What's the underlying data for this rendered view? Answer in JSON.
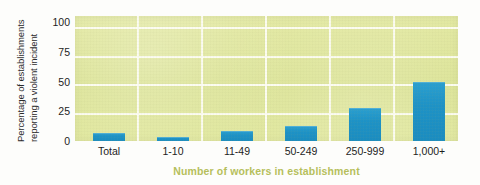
{
  "chart_data": {
    "type": "bar",
    "title": "",
    "subtitle": "",
    "xlabel": "Number of workers in establishment",
    "ylabel": "Percentage of establishments reporting a violent incident",
    "ylabel_lines": [
      "Percentage of establishments",
      "reporting a violent incident"
    ],
    "categories": [
      "Total",
      "1-10",
      "11-49",
      "50-249",
      "250-999",
      "1,000+"
    ],
    "values": [
      7,
      3.5,
      9,
      13,
      29,
      52
    ],
    "yticks": [
      0,
      25,
      50,
      75,
      100
    ],
    "ytick_labels": [
      "0",
      "25",
      "50",
      "75",
      "100"
    ],
    "ylim": [
      0,
      110
    ],
    "grid": "horizontal-and-vertical",
    "legend": "none",
    "series": [
      {
        "name": "Percentage of establishments reporting a violent incident",
        "values": [
          7,
          3.5,
          9,
          13,
          29,
          52
        ]
      }
    ],
    "colors": {
      "bar": "#1f96c8",
      "plot_background": "#dfe69a",
      "gridline": "#fdfdf4",
      "xlabel_text": "#b6bf5c",
      "tick_text": "#1d1d1d",
      "figure_background": "#fdfdfb"
    }
  }
}
